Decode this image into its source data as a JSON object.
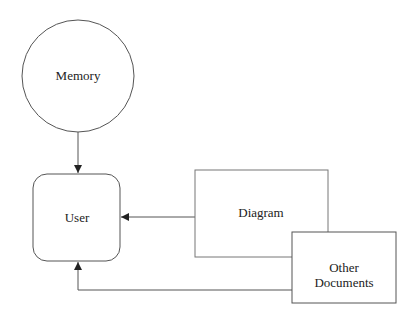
{
  "diagram": {
    "nodes": {
      "memory": {
        "label": "Memory",
        "shape": "circle"
      },
      "user": {
        "label": "User",
        "shape": "rounded-rectangle"
      },
      "diagram": {
        "label": "Diagram",
        "shape": "rectangle"
      },
      "other_documents": {
        "line1": "Other",
        "line2": "Documents",
        "shape": "rectangle"
      }
    },
    "edges": [
      {
        "from": "Memory",
        "to": "User"
      },
      {
        "from": "Diagram",
        "to": "User"
      },
      {
        "from": "Other Documents",
        "to": "User"
      }
    ],
    "colors": {
      "stroke": "#555555",
      "arrow": "#222222",
      "fill": "#ffffff"
    }
  }
}
